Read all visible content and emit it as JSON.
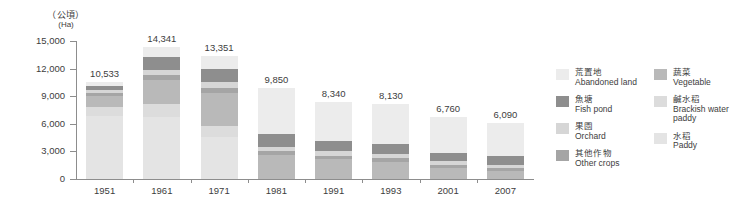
{
  "unit": {
    "cn": "（公頃）",
    "en": "(Ha)"
  },
  "axis": {
    "y_ticks": [
      "15,000",
      "12,000",
      "9,000",
      "6,000",
      "3,000",
      "0"
    ],
    "y_tick_values": [
      15000,
      12000,
      9000,
      6000,
      3000,
      0
    ]
  },
  "legend": {
    "column1": [
      {
        "cn": "荒置地",
        "en": "Abandoned land",
        "color": "#ececec"
      },
      {
        "cn": "魚塘",
        "en": "Fish pond",
        "color": "#8e8e8e"
      },
      {
        "cn": "果園",
        "en": "Orchard",
        "color": "#d6d6d6"
      },
      {
        "cn": "其他作物",
        "en": "Other crops",
        "color": "#a5a5a5"
      }
    ],
    "column2": [
      {
        "cn": "蔬菜",
        "en": "Vegetable",
        "color": "#b9b9b9"
      },
      {
        "cn": "鹹水稻",
        "en": "Brackish water paddy",
        "color": "#dcdcdc"
      },
      {
        "cn": "水稻",
        "en": "Paddy",
        "color": "#e4e4e4"
      }
    ]
  },
  "chart_data": {
    "type": "bar",
    "subtype": "stacked",
    "title": "",
    "xlabel": "",
    "ylabel": "（公頃） (Ha)",
    "ylim": [
      0,
      15000
    ],
    "grid": false,
    "legend_position": "right",
    "categories": [
      "1951",
      "1961",
      "1971",
      "1981",
      "1991",
      "1993",
      "2001",
      "2007"
    ],
    "totals": [
      10533,
      14341,
      13351,
      9850,
      8340,
      8130,
      6760,
      6090
    ],
    "total_labels": [
      "10,533",
      "14,341",
      "13,351",
      "9,850",
      "8,340",
      "8,130",
      "6,760",
      "6,090"
    ],
    "series": [
      {
        "name": "Paddy",
        "name_cn": "水稻",
        "color": "#e4e4e4",
        "values": [
          6900,
          6700,
          4600,
          0,
          0,
          0,
          0,
          0
        ]
      },
      {
        "name": "Brackish water paddy",
        "name_cn": "鹹水稻",
        "color": "#dcdcdc",
        "values": [
          900,
          1500,
          1200,
          0,
          0,
          0,
          0,
          0
        ]
      },
      {
        "name": "Vegetable",
        "name_cn": "蔬菜",
        "color": "#b9b9b9",
        "values": [
          1200,
          2600,
          3500,
          2600,
          2200,
          1900,
          1250,
          900
        ]
      },
      {
        "name": "Other crops",
        "name_cn": "其他作物",
        "color": "#a5a5a5",
        "values": [
          350,
          500,
          600,
          450,
          350,
          350,
          300,
          250
        ]
      },
      {
        "name": "Orchard",
        "name_cn": "果園",
        "color": "#d6d6d6",
        "values": [
          300,
          500,
          700,
          450,
          500,
          450,
          400,
          350
        ]
      },
      {
        "name": "Fish pond",
        "name_cn": "魚塘",
        "color": "#8e8e8e",
        "values": [
          450,
          1500,
          1400,
          1350,
          1100,
          1100,
          900,
          950
        ]
      },
      {
        "name": "Abandoned land",
        "name_cn": "荒置地",
        "color": "#ececec",
        "values": [
          433,
          1041,
          1351,
          5000,
          4190,
          4330,
          3910,
          3640
        ]
      }
    ]
  }
}
